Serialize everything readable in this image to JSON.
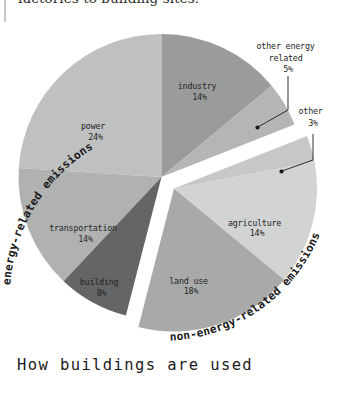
{
  "page": {
    "runover_text": "factories to building sites.",
    "caption": "How buildings are used"
  },
  "chart_data": {
    "type": "pie",
    "title": "",
    "unit": "%",
    "total": 100,
    "exploded": true,
    "group_labels": {
      "energy": "energy-related emissions",
      "non_energy": "non-energy-related emissions"
    },
    "categories": [
      "industry",
      "other energy related",
      "other",
      "agriculture",
      "land use",
      "building",
      "transportation",
      "power"
    ],
    "values": [
      14,
      5,
      3,
      14,
      18,
      8,
      14,
      24
    ],
    "slices": [
      {
        "label": "industry",
        "value": 14,
        "value_text": "14%",
        "color": "#9a9b9b",
        "group": "energy",
        "label_placement": "inside"
      },
      {
        "label": "other energy related",
        "value": 5,
        "value_text": "5%",
        "color": "#b4b6b6",
        "group": "energy",
        "label_placement": "callout"
      },
      {
        "label": "other",
        "value": 3,
        "value_text": "3%",
        "color": "#c6c7c7",
        "group": "non_energy",
        "label_placement": "callout"
      },
      {
        "label": "agriculture",
        "value": 14,
        "value_text": "14%",
        "color": "#d2d3d3",
        "group": "non_energy",
        "label_placement": "inside"
      },
      {
        "label": "land use",
        "value": 18,
        "value_text": "18%",
        "color": "#a8aaaa",
        "group": "non_energy",
        "label_placement": "inside"
      },
      {
        "label": "building",
        "value": 8,
        "value_text": "8%",
        "color": "#636566",
        "group": "energy",
        "label_placement": "inside"
      },
      {
        "label": "transportation",
        "value": 14,
        "value_text": "14%",
        "color": "#b0b2b2",
        "group": "energy",
        "label_placement": "inside"
      },
      {
        "label": "power",
        "value": 24,
        "value_text": "24%",
        "color": "#bfc0c0",
        "group": "energy",
        "label_placement": "inside"
      }
    ],
    "callouts": [
      {
        "label": "other energy related",
        "lines": [
          "other energy",
          "related"
        ],
        "value_text": "5%"
      },
      {
        "label": "other",
        "lines": [
          "other"
        ],
        "value_text": "3%"
      }
    ]
  }
}
